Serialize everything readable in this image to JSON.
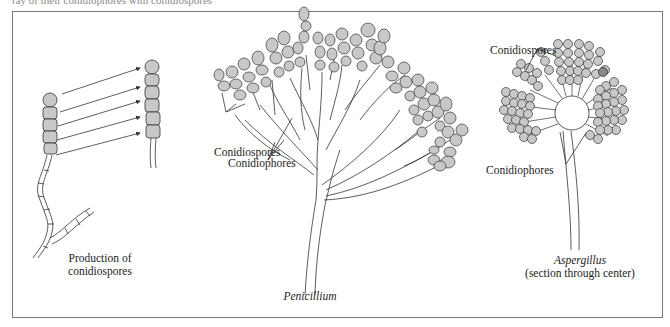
{
  "header": {
    "cutoff_text": "ray of their conidiophores with conidiospores"
  },
  "panels": [
    {
      "id": "production",
      "caption_line1": "Production of",
      "caption_line2": "conidiospores"
    },
    {
      "id": "penicillium",
      "caption": "Penicillium",
      "labels": {
        "spores": "Conidiospores",
        "phores": "Conidiophores"
      }
    },
    {
      "id": "aspergillus",
      "caption": "Aspergillus",
      "subcaption": "(section through center)",
      "labels": {
        "spores": "Conidiospores",
        "phores": "Conidiophores"
      }
    }
  ],
  "colors": {
    "spore_fill": "#c8c8c8",
    "stroke": "#333333",
    "frame": "#777777"
  }
}
